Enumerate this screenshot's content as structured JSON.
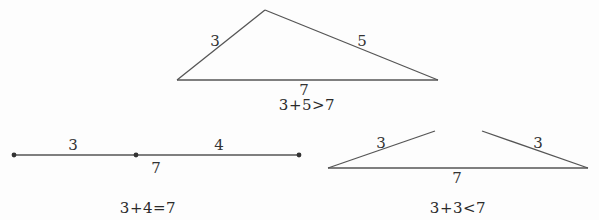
{
  "figure": {
    "colors": {
      "line": "#555555",
      "text": "#333333",
      "background": "#fdfdfd"
    },
    "panels": [
      {
        "id": "valid-triangle",
        "caption": "3+5>7",
        "sides": {
          "left": "3",
          "right": "5",
          "base": "7"
        },
        "vertices": {
          "left": [
            177,
            80
          ],
          "apex": [
            265,
            10
          ],
          "right": [
            438,
            80
          ]
        }
      },
      {
        "id": "degenerate-segment",
        "caption": "3+4=7",
        "labels": {
          "first": "3",
          "second": "4",
          "total": "7"
        },
        "points": [
          [
            14,
            155
          ],
          [
            136,
            155
          ],
          [
            299,
            155
          ]
        ]
      },
      {
        "id": "impossible-triangle",
        "caption": "3+3<7",
        "sides": {
          "left": "3",
          "right": "3",
          "base": "7"
        },
        "base": [
          [
            328,
            168
          ],
          [
            588,
            168
          ]
        ],
        "left_arm": [
          [
            328,
            168
          ],
          [
            435,
            131
          ]
        ],
        "right_arm": [
          [
            482,
            131
          ],
          [
            588,
            168
          ]
        ]
      }
    ]
  }
}
